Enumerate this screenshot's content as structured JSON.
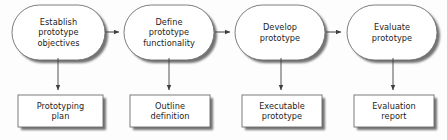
{
  "diagram": {
    "type": "flow-diagram",
    "background_color": "#fdfdfd",
    "shape_fill": "#ffffff",
    "shape_stroke": "#6e6e6e",
    "shadow_color": "#b4b4b4",
    "text_color": "#1d1d1d",
    "arrow_color": "#3f3f3f",
    "stages": [
      {
        "id": "establish-prototype-objectives",
        "label": "Establish\nprototype\nobjectives",
        "x": 12,
        "y": 5,
        "width": 93,
        "height": 55
      },
      {
        "id": "define-prototype-functionality",
        "label": "Define\nprototype\nfunctionality",
        "x": 124,
        "y": 5,
        "width": 90,
        "height": 55
      },
      {
        "id": "develop-prototype",
        "label": "Develop\nprototype",
        "x": 235,
        "y": 5,
        "width": 90,
        "height": 55
      },
      {
        "id": "evaluate-prototype",
        "label": "Evaluate\nprototype",
        "x": 347,
        "y": 5,
        "width": 90,
        "height": 55
      }
    ],
    "artifacts": [
      {
        "id": "prototyping-plan",
        "label": "Prototyping\nplan",
        "x": 18,
        "y": 95,
        "width": 85,
        "height": 32
      },
      {
        "id": "outline-definition",
        "label": "Outline\ndefinition",
        "x": 130,
        "y": 95,
        "width": 80,
        "height": 32
      },
      {
        "id": "executable-prototype",
        "label": "Executable\nprototype",
        "x": 242,
        "y": 95,
        "width": 80,
        "height": 32
      },
      {
        "id": "evaluation-report",
        "label": "Evaluation\nreport",
        "x": 354,
        "y": 95,
        "width": 80,
        "height": 32
      }
    ],
    "flow_arrows": [
      {
        "id": "arrow-establish-to-define",
        "x1": 105,
        "y1": 32,
        "x2": 123,
        "y2": 32
      },
      {
        "id": "arrow-define-to-develop",
        "x1": 215,
        "y1": 32,
        "x2": 234,
        "y2": 32
      },
      {
        "id": "arrow-develop-to-evaluate",
        "x1": 326,
        "y1": 32,
        "x2": 346,
        "y2": 32
      }
    ],
    "output_arrows": [
      {
        "id": "arrow-establish-to-plan",
        "x1": 58,
        "y1": 60,
        "x2": 58,
        "y2": 94
      },
      {
        "id": "arrow-define-to-outline",
        "x1": 169,
        "y1": 60,
        "x2": 169,
        "y2": 94
      },
      {
        "id": "arrow-develop-to-executable",
        "x1": 281,
        "y1": 60,
        "x2": 281,
        "y2": 94
      },
      {
        "id": "arrow-evaluate-to-report",
        "x1": 393,
        "y1": 60,
        "x2": 393,
        "y2": 94
      }
    ]
  }
}
